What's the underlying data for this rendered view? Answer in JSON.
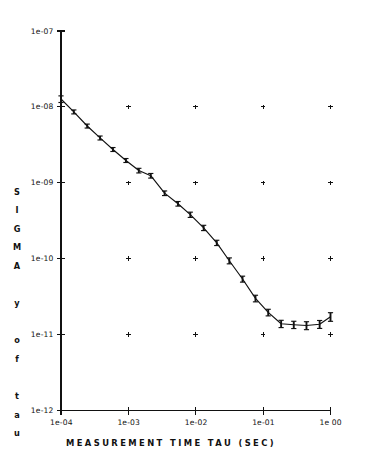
{
  "chart_data": {
    "type": "line",
    "title": "",
    "subtitle": "",
    "xlabel": "MEASUREMENT TIME TAU (SEC)",
    "ylabel": "SIGMA y of tau",
    "ylabel_letters": [
      "S",
      "I",
      "G",
      "M",
      "A",
      "",
      "y",
      "",
      "o",
      "f",
      "",
      "t",
      "a",
      "u"
    ],
    "xscale": "log",
    "yscale": "log",
    "xlim": [
      0.0001,
      1.0
    ],
    "ylim": [
      1e-12,
      1e-07
    ],
    "grid": "plus-marks",
    "legend": "none",
    "xtick_labels": [
      "1e-04",
      "1e-03",
      "1e-02",
      "1e-01",
      "1e 00"
    ],
    "xtick_values": [
      0.0001,
      0.001,
      0.01,
      0.1,
      1.0
    ],
    "ytick_labels": [
      "1e-07",
      "1e-08",
      "1e-09",
      "1e-10",
      "1e-11",
      "1e-12"
    ],
    "ytick_values": [
      1e-07,
      1e-08,
      1e-09,
      1e-10,
      1e-11,
      1e-12
    ],
    "series": [
      {
        "name": "sigma_y(tau)",
        "marker": "errorbar",
        "x": [
          0.0001,
          0.000155,
          0.000245,
          0.00038,
          0.00059,
          0.00092,
          0.00143,
          0.00215,
          0.00345,
          0.00545,
          0.0083,
          0.0131,
          0.0205,
          0.0315,
          0.0495,
          0.077,
          0.119,
          0.185,
          0.285,
          0.44,
          0.69,
          1.0
        ],
        "y": [
          1.27e-08,
          8.6e-09,
          5.6e-09,
          3.9e-09,
          2.75e-09,
          1.97e-09,
          1.45e-09,
          1.24e-09,
          7.3e-10,
          5.3e-10,
          3.8e-10,
          2.55e-10,
          1.62e-10,
          9.4e-11,
          5.4e-11,
          3e-11,
          1.96e-11,
          1.39e-11,
          1.35e-11,
          1.32e-11,
          1.37e-11,
          1.72e-11
        ],
        "yerr_rel": [
          0.1,
          0.06,
          0.06,
          0.06,
          0.06,
          0.06,
          0.07,
          0.07,
          0.07,
          0.07,
          0.08,
          0.08,
          0.08,
          0.09,
          0.09,
          0.1,
          0.1,
          0.11,
          0.11,
          0.12,
          0.12,
          0.13
        ]
      }
    ]
  },
  "colors": {
    "ink": "#111111",
    "background": "#ffffff"
  }
}
